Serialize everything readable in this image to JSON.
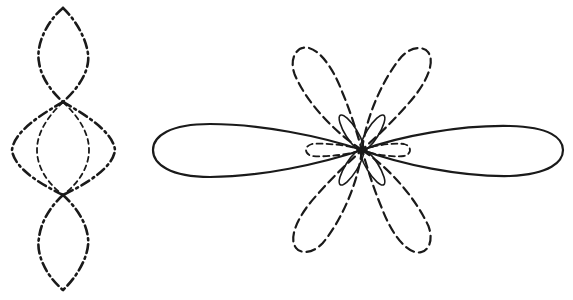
{
  "figure": {
    "background": "#ffffff",
    "ink_color": "#1a1a1a",
    "panels": [
      {
        "id": "left",
        "description": "Vertical standing-wave style pattern of crossing lens-shaped curves",
        "center_x": 63,
        "nodes_y": [
          8,
          102,
          195,
          290
        ],
        "curves": [
          {
            "name": "top-lobe",
            "style": "dash-dot",
            "half_width": 25
          },
          {
            "name": "middle-outer-lobe",
            "style": "dash-dot",
            "half_width": 51
          },
          {
            "name": "middle-inner-lobe",
            "style": "short-dash",
            "half_width": 25
          },
          {
            "name": "bottom-lobe",
            "style": "dash-dot",
            "half_width": 25
          }
        ]
      },
      {
        "id": "right",
        "description": "Polar radiation pattern with main solid lobes and dashed side lobes",
        "center": [
          362,
          150
        ],
        "lobes": [
          {
            "name": "main-left",
            "style": "solid",
            "length": 209,
            "half_width": 27
          },
          {
            "name": "main-right",
            "style": "solid",
            "length": 201,
            "half_width": 27
          },
          {
            "name": "dashed-upper-left",
            "style": "dashed",
            "angle_deg": 122
          },
          {
            "name": "dashed-upper-right",
            "style": "dashed",
            "angle_deg": 58
          },
          {
            "name": "dashed-lower-left",
            "style": "dashed",
            "angle_deg": 238
          },
          {
            "name": "dashed-lower-right",
            "style": "dashed",
            "angle_deg": 302
          },
          {
            "name": "small-solid-upper-left",
            "style": "solid-thin",
            "angle_deg": 122
          },
          {
            "name": "small-solid-upper-right",
            "style": "solid-thin",
            "angle_deg": 58
          },
          {
            "name": "small-solid-lower-left",
            "style": "solid-thin",
            "angle_deg": 238
          },
          {
            "name": "small-solid-lower-right",
            "style": "solid-thin",
            "angle_deg": 302
          },
          {
            "name": "short-dashed-left",
            "style": "dashed",
            "length": 55,
            "half_width": 7
          },
          {
            "name": "short-dashed-right",
            "style": "dashed",
            "length": 48,
            "half_width": 7
          }
        ]
      }
    ]
  }
}
